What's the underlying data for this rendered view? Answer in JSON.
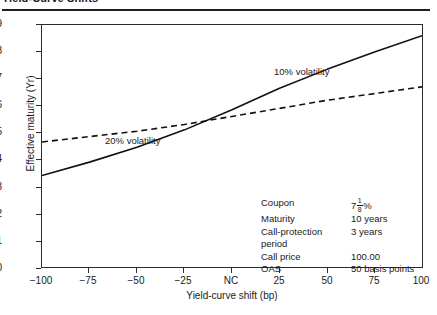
{
  "figure": {
    "title": "Yield-Curve Shifts"
  },
  "chart_data": {
    "type": "line",
    "title": "Yield-Curve Shifts",
    "xlabel": "Yield-curve shift (bp)",
    "ylabel": "Effective maturity (Yr)",
    "xlim": [
      -100,
      100
    ],
    "ylim": [
      0,
      9
    ],
    "xticks": [
      -100,
      -75,
      -50,
      -25,
      0,
      25,
      50,
      75,
      100
    ],
    "xticklabels": [
      "−100",
      "−75",
      "−50",
      "−25",
      "NC",
      "25",
      "50",
      "75",
      "100"
    ],
    "yticks": [
      0,
      1,
      2,
      3,
      4,
      5,
      6,
      7,
      8,
      9
    ],
    "yticklabels": [
      "0",
      "1",
      "2",
      "3",
      "4",
      "5",
      "6",
      "7",
      "8",
      "9"
    ],
    "grid": false,
    "legend": "annotations-on-curves",
    "series": [
      {
        "name": "10% volatility",
        "style": "solid",
        "color": "#111111",
        "x": [
          -100,
          -75,
          -50,
          -25,
          0,
          25,
          50,
          75,
          100
        ],
        "y": [
          3.4,
          3.9,
          4.45,
          5.1,
          5.85,
          6.65,
          7.35,
          8.0,
          8.6
        ]
      },
      {
        "name": "20% volatility",
        "style": "dashed",
        "color": "#111111",
        "x": [
          -100,
          -75,
          -50,
          -25,
          0,
          25,
          50,
          75,
          100
        ],
        "y": [
          4.65,
          4.85,
          5.05,
          5.3,
          5.6,
          5.9,
          6.2,
          6.45,
          6.7
        ]
      }
    ],
    "annotations": [
      {
        "text": "10% volatility",
        "x": 22,
        "y": 8.4
      },
      {
        "text": "20% volatility",
        "x": -88,
        "y": 5.85
      }
    ]
  },
  "spec": {
    "rows": [
      {
        "key": "Coupon",
        "value": "7 1/8 %",
        "value_whole": "7",
        "value_num": "1",
        "value_den": "8",
        "value_suffix": "%"
      },
      {
        "key": "Maturity",
        "value": "10 years"
      },
      {
        "key": "Call-protection",
        "value": "3 years"
      },
      {
        "key": "period",
        "value": ""
      },
      {
        "key": "Call price",
        "value": "100.00"
      },
      {
        "key": "OAS",
        "value": "50 basis points"
      }
    ]
  }
}
